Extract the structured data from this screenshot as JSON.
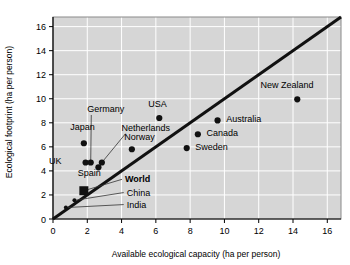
{
  "chart_data": {
    "type": "scatter",
    "title": "",
    "xlabel": "Available ecological capacity (ha per person)",
    "ylabel": "Ecological footprint (ha per person)",
    "xlim": [
      0,
      16.8
    ],
    "ylim": [
      0,
      16.8
    ],
    "xticks": [
      0,
      2,
      4,
      6,
      8,
      10,
      12,
      14,
      16
    ],
    "yticks": [
      0,
      2,
      4,
      6,
      8,
      10,
      12,
      14,
      16
    ],
    "xtick_labels": [
      "0",
      "2",
      "4",
      "6",
      "8",
      "10",
      "12",
      "14",
      "16"
    ],
    "ytick_labels": [
      "0",
      "2",
      "4",
      "6",
      "8",
      "10",
      "12",
      "14",
      "16"
    ],
    "grid": true,
    "legend": "none",
    "reference_line": {
      "name": "one-to-one-line",
      "type": "identity",
      "from": [
        0,
        0
      ],
      "to": [
        16.8,
        16.8
      ],
      "description": "footprint equals capacity"
    },
    "points": [
      {
        "name": "Japan",
        "x": 1.8,
        "y": 6.3,
        "marker": "circle",
        "label": "Japan",
        "label_pos": "above",
        "label_x": 1.0,
        "label_y": 7.4,
        "leader": false,
        "bold": false
      },
      {
        "name": "UK",
        "x": 1.9,
        "y": 4.7,
        "marker": "circle",
        "label": "UK",
        "label_pos": "left",
        "label_x": 0.5,
        "label_y": 4.55,
        "leader": false,
        "bold": false
      },
      {
        "name": "Germany",
        "x": 2.2,
        "y": 4.7,
        "marker": "circle",
        "label": "Germany",
        "label_pos": "leader",
        "label_x": 2.0,
        "label_y": 8.9,
        "leader": true,
        "bold": false
      },
      {
        "name": "Spain",
        "x": 2.65,
        "y": 4.3,
        "marker": "circle",
        "label": "Spain",
        "label_pos": "below",
        "label_x": 1.45,
        "label_y": 3.6,
        "leader": false,
        "bold": false
      },
      {
        "name": "Netherlands",
        "x": 2.85,
        "y": 4.7,
        "marker": "circle",
        "label": "Netherlands",
        "label_pos": "leader",
        "label_x": 4.0,
        "label_y": 7.35,
        "leader": true,
        "bold": false
      },
      {
        "name": "Norway",
        "x": 4.6,
        "y": 5.8,
        "marker": "circle",
        "label": "Norway",
        "label_pos": "above",
        "label_x": 4.15,
        "label_y": 6.6,
        "leader": false,
        "bold": false
      },
      {
        "name": "USA",
        "x": 6.2,
        "y": 8.4,
        "marker": "circle",
        "label": "USA",
        "label_pos": "above",
        "label_x": 5.55,
        "label_y": 9.35,
        "leader": false,
        "bold": false
      },
      {
        "name": "Sweden",
        "x": 7.8,
        "y": 5.9,
        "marker": "circle",
        "label": "Sweden",
        "label_pos": "right",
        "label_x": 8.3,
        "label_y": 5.75,
        "leader": false,
        "bold": false
      },
      {
        "name": "Canada",
        "x": 8.45,
        "y": 7.05,
        "marker": "circle",
        "label": "Canada",
        "label_pos": "right",
        "label_x": 8.95,
        "label_y": 6.9,
        "leader": false,
        "bold": false
      },
      {
        "name": "Australia",
        "x": 9.6,
        "y": 8.2,
        "marker": "circle",
        "label": "Australia",
        "label_pos": "right",
        "label_x": 10.1,
        "label_y": 8.05,
        "leader": false,
        "bold": false
      },
      {
        "name": "New Zealand",
        "x": 14.25,
        "y": 9.95,
        "marker": "circle",
        "label": "New Zealand",
        "label_pos": "above",
        "label_x": 12.1,
        "label_y": 10.9,
        "leader": false,
        "bold": false
      },
      {
        "name": "World",
        "x": 1.8,
        "y": 2.35,
        "marker": "square",
        "label": "World",
        "label_pos": "leader",
        "label_x": 4.2,
        "label_y": 3.05,
        "leader": true,
        "bold": true
      },
      {
        "name": "China",
        "x": 1.25,
        "y": 1.55,
        "marker": "small",
        "label": "China",
        "label_pos": "leader",
        "label_x": 4.3,
        "label_y": 1.95,
        "leader": true,
        "bold": false
      },
      {
        "name": "India",
        "x": 0.75,
        "y": 0.95,
        "marker": "small",
        "label": "India",
        "label_pos": "leader",
        "label_x": 4.3,
        "label_y": 0.95,
        "leader": true,
        "bold": false
      }
    ],
    "colors": {
      "plot_background": "#d6d6d6",
      "gridline": "#ffffff",
      "marker": "#111111",
      "reference_line": "#111111",
      "text": "#000000",
      "page_background": "#ffffff"
    }
  }
}
